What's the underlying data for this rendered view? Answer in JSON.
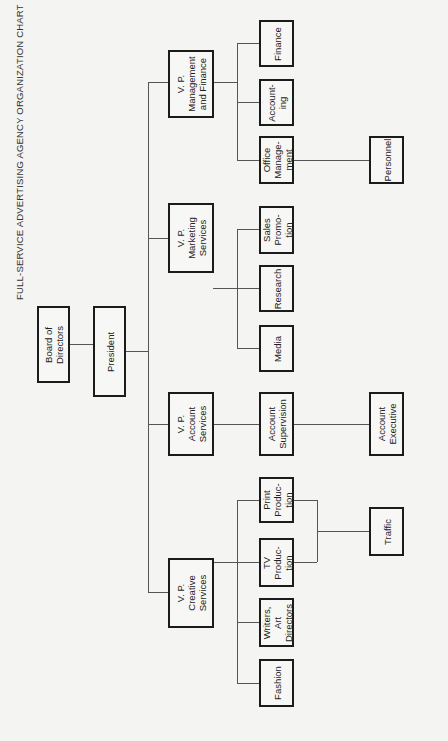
{
  "title": "FULL-SERVICE ADVERTISING AGENCY ORGANIZATION CHART",
  "orientation": "rotated 90 degrees counter-clockwise",
  "nodes": {
    "board": {
      "label": "Board of\nDirectors"
    },
    "president": {
      "label": "President"
    },
    "vp_management_finance": {
      "label": "V. P.\nManagement\nand Finance"
    },
    "vp_marketing": {
      "label": "V. P.\nMarketing\nServices"
    },
    "vp_account": {
      "label": "V. P.\nAccount\nServices"
    },
    "vp_creative": {
      "label": "V. P.\nCreative\nServices"
    },
    "finance": {
      "label": "Finance"
    },
    "accounting": {
      "label": "Account-\ning"
    },
    "office_management": {
      "label": "Office\nManage-\nment"
    },
    "personnel": {
      "label": "Personnel"
    },
    "sales_promotion": {
      "label": "Sales\nPromo-\ntion"
    },
    "research": {
      "label": "Research"
    },
    "media": {
      "label": "Media"
    },
    "account_supervision": {
      "label": "Account\nSupervision"
    },
    "account_executive": {
      "label": "Account\nExecutive"
    },
    "print_production": {
      "label": "Print\nProduc-\ntion"
    },
    "tv_production": {
      "label": "TV\nProduc-\ntion"
    },
    "writers_art_directors": {
      "label": "Writers,\nArt\nDirectors"
    },
    "fashion": {
      "label": "Fashion"
    },
    "traffic": {
      "label": "Traffic"
    }
  },
  "hierarchy": {
    "board": [
      "president"
    ],
    "president": [
      "vp_management_finance",
      "vp_marketing",
      "vp_account",
      "vp_creative"
    ],
    "vp_management_finance": [
      "finance",
      "accounting",
      "office_management"
    ],
    "office_management": [
      "personnel"
    ],
    "vp_marketing": [
      "sales_promotion",
      "research",
      "media"
    ],
    "vp_account": [
      "account_supervision"
    ],
    "account_supervision": [
      "account_executive"
    ],
    "vp_creative": [
      "print_production",
      "tv_production",
      "writers_art_directors",
      "fashion"
    ],
    "print_production": [
      "traffic"
    ],
    "tv_production": [
      "traffic"
    ]
  },
  "colors": {
    "background": "#f4f4f2",
    "border": "#1b1b1b",
    "connector": "#555555"
  }
}
